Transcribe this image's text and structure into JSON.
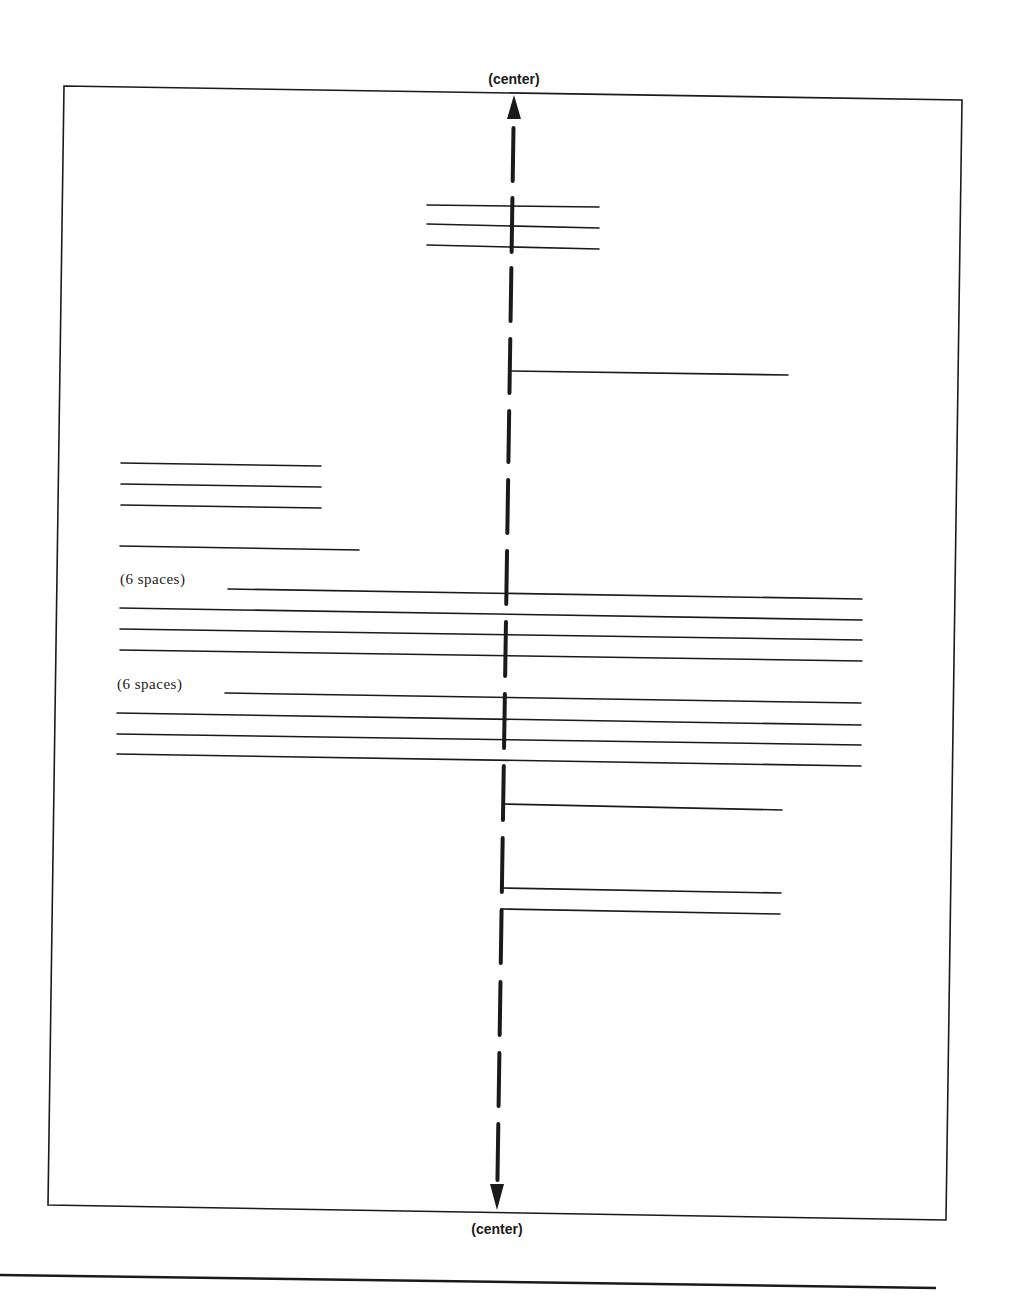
{
  "labels": {
    "top_center": "(center)",
    "bottom_center": "(center)",
    "indent_1": "(6 spaces)",
    "indent_2": "(6 spaces)"
  },
  "colors": {
    "ink": "#1a1a1a",
    "background": "#ffffff"
  },
  "page_frame": {
    "top_left": [
      64,
      86
    ],
    "top_right": [
      962,
      100
    ],
    "bottom_left": [
      48,
      1205
    ],
    "bottom_right": [
      946,
      1220
    ]
  },
  "center_axis": {
    "top": [
      514,
      95
    ],
    "bottom": [
      497,
      1210
    ],
    "dashes": [
      [
        128,
        181
      ],
      [
        198,
        252
      ],
      [
        268,
        321
      ],
      [
        339,
        393
      ],
      [
        411,
        462
      ],
      [
        480,
        533
      ],
      [
        551,
        604
      ],
      [
        622,
        676
      ],
      [
        694,
        748
      ],
      [
        766,
        820
      ],
      [
        838,
        892
      ],
      [
        910,
        963
      ],
      [
        982,
        1035
      ],
      [
        1053,
        1106
      ],
      [
        1124,
        1180
      ]
    ]
  },
  "title_block": {
    "lines": [
      {
        "x1": 427,
        "y1": 205,
        "x2": 599,
        "y2": 207
      },
      {
        "x1": 427,
        "y1": 224,
        "x2": 599,
        "y2": 228
      },
      {
        "x1": 427,
        "y1": 245,
        "x2": 599,
        "y2": 249
      }
    ]
  },
  "right_start_lines": [
    {
      "x1": 511,
      "y1": 371,
      "x2": 788,
      "y2": 375
    },
    {
      "x1": 502,
      "y1": 804,
      "x2": 782,
      "y2": 810
    },
    {
      "x1": 502,
      "y1": 888,
      "x2": 781,
      "y2": 893
    },
    {
      "x1": 502,
      "y1": 909,
      "x2": 780,
      "y2": 914
    }
  ],
  "left_block": {
    "lines": [
      {
        "x1": 121,
        "y1": 463,
        "x2": 321,
        "y2": 466
      },
      {
        "x1": 121,
        "y1": 484,
        "x2": 321,
        "y2": 487
      },
      {
        "x1": 121,
        "y1": 505,
        "x2": 321,
        "y2": 508
      },
      {
        "x1": 120,
        "y1": 546,
        "x2": 359,
        "y2": 550
      }
    ]
  },
  "paragraphs": [
    {
      "label_key": "indent_1",
      "label_pos": [
        120,
        584
      ],
      "lines": [
        {
          "x1": 228,
          "y1": 589,
          "x2": 862,
          "y2": 599
        },
        {
          "x1": 120,
          "y1": 608,
          "x2": 862,
          "y2": 620
        },
        {
          "x1": 120,
          "y1": 629,
          "x2": 862,
          "y2": 640
        },
        {
          "x1": 120,
          "y1": 650,
          "x2": 862,
          "y2": 661
        }
      ]
    },
    {
      "label_key": "indent_2",
      "label_pos": [
        117,
        689
      ],
      "lines": [
        {
          "x1": 225,
          "y1": 693,
          "x2": 861,
          "y2": 703
        },
        {
          "x1": 117,
          "y1": 713,
          "x2": 861,
          "y2": 725
        },
        {
          "x1": 117,
          "y1": 734,
          "x2": 861,
          "y2": 745
        },
        {
          "x1": 117,
          "y1": 754,
          "x2": 861,
          "y2": 766
        }
      ]
    }
  ],
  "footer_rule": {
    "x1": 0,
    "y1": 1275,
    "x2": 936,
    "y2": 1288
  }
}
